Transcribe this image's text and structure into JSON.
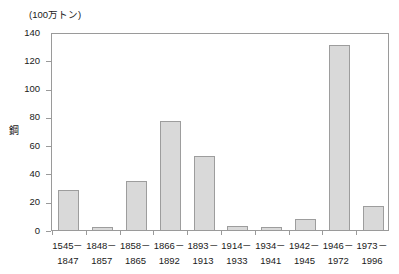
{
  "chart_data": {
    "type": "bar",
    "title": "",
    "subtitle": "",
    "unit_caption": "(100万トン)",
    "xlabel": "",
    "ylabel": "鋼",
    "ylim": [
      0,
      140
    ],
    "y_ticks": [
      0,
      20,
      40,
      60,
      80,
      100,
      120,
      140
    ],
    "grid": false,
    "legend": null,
    "categories": [
      "1545－\n1847",
      "1848－\n1857",
      "1858－\n1865",
      "1866－\n1892",
      "1893－\n1913",
      "1914－\n1933",
      "1934－\n1941",
      "1942－\n1945",
      "1946－\n1972",
      "1973－\n1996"
    ],
    "category_lines": [
      {
        "top": "1545－",
        "bottom": "1847"
      },
      {
        "top": "1848－",
        "bottom": "1857"
      },
      {
        "top": "1858－",
        "bottom": "1865"
      },
      {
        "top": "1866－",
        "bottom": "1892"
      },
      {
        "top": "1893－",
        "bottom": "1913"
      },
      {
        "top": "1914－",
        "bottom": "1933"
      },
      {
        "top": "1934－",
        "bottom": "1941"
      },
      {
        "top": "1942－",
        "bottom": "1945"
      },
      {
        "top": "1946－",
        "bottom": "1972"
      },
      {
        "top": "1973－",
        "bottom": "1996"
      }
    ],
    "values": [
      28,
      2,
      35,
      77,
      52,
      3,
      2,
      8,
      131,
      17
    ],
    "bar_fill_color": "#d9d9d9",
    "bar_border_color": "#9d9d9d",
    "axis_color": "#9a9a9a",
    "text_color": "#1a1a1a",
    "background_color": "#ffffff"
  }
}
